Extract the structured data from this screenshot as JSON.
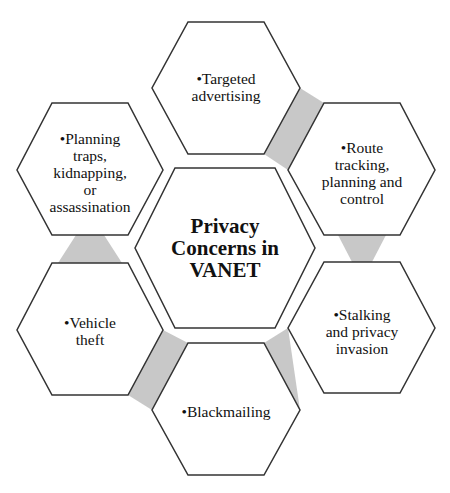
{
  "diagram": {
    "title_lines": [
      "Privacy",
      "Concerns in",
      "VANET"
    ],
    "colors": {
      "hex_stroke": "#333333",
      "hex_fill": "#ffffff",
      "connector_fill": "#c8c8c8",
      "text": "#111111"
    },
    "nodes": [
      {
        "id": "targeted-advertising",
        "lines": [
          "•Targeted",
          "advertising"
        ]
      },
      {
        "id": "route-tracking",
        "lines": [
          "•Route",
          "tracking,",
          "planning and",
          "control"
        ]
      },
      {
        "id": "stalking",
        "lines": [
          "•Stalking",
          "and privacy",
          "invasion"
        ]
      },
      {
        "id": "blackmailing",
        "lines": [
          "•Blackmailing"
        ]
      },
      {
        "id": "vehicle-theft",
        "lines": [
          "•Vehicle",
          "theft"
        ]
      },
      {
        "id": "planning-traps",
        "lines": [
          "•Planning",
          "traps,",
          "kidnapping,",
          "or",
          "assassination"
        ]
      }
    ]
  }
}
